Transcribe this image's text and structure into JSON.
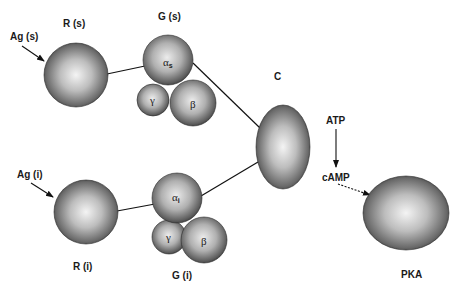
{
  "diagram": {
    "labels": {
      "ag_s": "Ag (s)",
      "r_s": "R (s)",
      "g_s": "G (s)",
      "c": "C",
      "atp": "ATP",
      "camp": "cAMP",
      "ag_i": "Ag (i)",
      "r_i": "R (i)",
      "g_i": "G (i)",
      "pka": "PKA"
    },
    "subunits": {
      "alpha": "α",
      "alpha_s_sub": "s",
      "alpha_i_sub": "i",
      "gamma": "γ",
      "beta": "β"
    },
    "nodes": [
      {
        "id": "R(s)",
        "shape": "sphere"
      },
      {
        "id": "G(s) alpha_s",
        "shape": "sphere"
      },
      {
        "id": "G(s) gamma",
        "shape": "sphere"
      },
      {
        "id": "G(s) beta",
        "shape": "sphere"
      },
      {
        "id": "C",
        "shape": "ellipsoid"
      },
      {
        "id": "R(i)",
        "shape": "sphere"
      },
      {
        "id": "G(i) alpha_i",
        "shape": "sphere"
      },
      {
        "id": "G(i) gamma",
        "shape": "sphere"
      },
      {
        "id": "G(i) beta",
        "shape": "sphere"
      },
      {
        "id": "PKA",
        "shape": "ellipsoid"
      }
    ],
    "edges": [
      {
        "from": "Ag (s)",
        "to": "R(s)",
        "type": "arrow"
      },
      {
        "from": "R(s)",
        "to": "G(s) alpha_s",
        "type": "line"
      },
      {
        "from": "G(s) alpha_s",
        "to": "C",
        "type": "line"
      },
      {
        "from": "Ag (i)",
        "to": "R(i)",
        "type": "arrow"
      },
      {
        "from": "R(i)",
        "to": "G(i) alpha_i",
        "type": "line"
      },
      {
        "from": "G(i) alpha_i",
        "to": "C",
        "type": "line"
      },
      {
        "from": "ATP",
        "to": "cAMP",
        "type": "arrow"
      },
      {
        "from": "cAMP",
        "to": "PKA",
        "type": "dashed-arrow"
      }
    ]
  }
}
